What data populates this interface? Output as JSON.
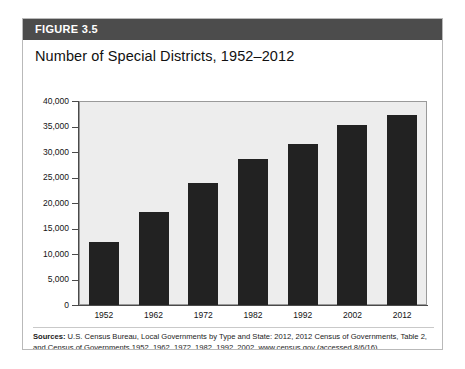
{
  "figure": {
    "header_label": "FIGURE 3.5",
    "title": "Number of Special Districts, 1952–2012",
    "source_prefix": "Sources:",
    "source_text": " U.S. Census Bureau, Local Governments by Type and State: 2012, 2012 Census of Governments, Table 2, and Census of Governments 1952, 1962, 1972, 1982, 1992, 2002, www.census.gov (accessed 8/6/16)."
  },
  "colors": {
    "header_bar": "#4c4c4c",
    "header_text": "#ffffff",
    "bar_fill": "#222222",
    "plot_background": "#ededed",
    "axis_line": "#4a4a4a",
    "card_border": "#b9b9b9"
  },
  "chart_data": {
    "type": "bar",
    "title": "Number of Special Districts, 1952–2012",
    "xlabel": "",
    "ylabel": "",
    "categories": [
      "1952",
      "1962",
      "1972",
      "1982",
      "1992",
      "2002",
      "2012"
    ],
    "values": [
      12340,
      18323,
      23885,
      28588,
      31555,
      35356,
      37203
    ],
    "ylim": [
      0,
      40000
    ],
    "ytick_values": [
      0,
      5000,
      10000,
      15000,
      20000,
      25000,
      30000,
      35000,
      40000
    ],
    "ytick_labels": [
      "0",
      "5,000",
      "10,000",
      "15,000",
      "20,000",
      "25,000",
      "30,000",
      "35,000",
      "40,000"
    ],
    "grid": false,
    "legend": null,
    "series": [
      {
        "name": "Special Districts",
        "values": [
          12340,
          18323,
          23885,
          28588,
          31555,
          35356,
          37203
        ]
      }
    ]
  }
}
